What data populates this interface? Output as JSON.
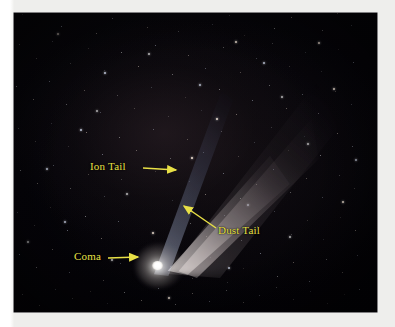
{
  "figure": {
    "kind": "annotated-astrophotograph",
    "background_color": "#040307",
    "frame_color": "#ffffff",
    "annotation_color": "#e8e046"
  },
  "annotations": [
    {
      "id": "ion-tail",
      "label": "Ion Tail",
      "icon": "arrow-right-icon",
      "arrow_direction": "right",
      "label_x": 90,
      "label_y": 160,
      "arrow_start": [
        143,
        168
      ],
      "arrow_end": [
        176,
        170
      ]
    },
    {
      "id": "dust-tail",
      "label": "Dust Tail",
      "icon": "arrow-up-left-icon",
      "arrow_direction": "up-left",
      "label_x": 218,
      "label_y": 224,
      "arrow_start": [
        216,
        228
      ],
      "arrow_end": [
        184,
        206
      ]
    },
    {
      "id": "coma",
      "label": "Coma",
      "icon": "arrow-right-icon",
      "arrow_direction": "right",
      "label_x": 74,
      "label_y": 250,
      "arrow_start": [
        108,
        258
      ],
      "arrow_end": [
        138,
        257
      ]
    }
  ],
  "features": {
    "coma": {
      "name": "Coma",
      "description": "bright white nucleus and surrounding coma",
      "center": [
        143,
        253
      ]
    },
    "ion_tail": {
      "name": "Ion Tail",
      "description": "narrow bluish streak along the upper-left edge of the tail fan",
      "color": "#aab4d4"
    },
    "dust_tail": {
      "name": "Dust Tail",
      "description": "broad whitish-tan fan sweeping up and to the right",
      "color": "#d8d0cc"
    }
  },
  "stars": {
    "faint": [
      [
        22,
        14
      ],
      [
        44,
        9
      ],
      [
        61,
        26
      ],
      [
        83,
        6
      ],
      [
        96,
        33
      ],
      [
        112,
        18
      ],
      [
        129,
        8
      ],
      [
        147,
        27
      ],
      [
        161,
        12
      ],
      [
        178,
        31
      ],
      [
        196,
        7
      ],
      [
        212,
        24
      ],
      [
        229,
        15
      ],
      [
        244,
        35
      ],
      [
        258,
        10
      ],
      [
        274,
        28
      ],
      [
        291,
        17
      ],
      [
        306,
        6
      ],
      [
        322,
        30
      ],
      [
        337,
        13
      ],
      [
        351,
        25
      ],
      [
        19,
        44
      ],
      [
        36,
        58
      ],
      [
        52,
        41
      ],
      [
        70,
        63
      ],
      [
        88,
        48
      ],
      [
        104,
        70
      ],
      [
        121,
        52
      ],
      [
        138,
        66
      ],
      [
        155,
        45
      ],
      [
        172,
        74
      ],
      [
        188,
        55
      ],
      [
        205,
        68
      ],
      [
        223,
        47
      ],
      [
        240,
        72
      ],
      [
        256,
        58
      ],
      [
        272,
        43
      ],
      [
        289,
        66
      ],
      [
        305,
        52
      ],
      [
        321,
        71
      ],
      [
        338,
        49
      ],
      [
        353,
        62
      ],
      [
        16,
        86
      ],
      [
        33,
        99
      ],
      [
        49,
        81
      ],
      [
        66,
        104
      ],
      [
        84,
        90
      ],
      [
        100,
        112
      ],
      [
        117,
        95
      ],
      [
        134,
        108
      ],
      [
        151,
        87
      ],
      [
        168,
        116
      ],
      [
        185,
        97
      ],
      [
        201,
        110
      ],
      [
        219,
        89
      ],
      [
        236,
        114
      ],
      [
        252,
        100
      ],
      [
        269,
        85
      ],
      [
        286,
        108
      ],
      [
        302,
        94
      ],
      [
        318,
        113
      ],
      [
        335,
        91
      ],
      [
        351,
        104
      ],
      [
        18,
        128
      ],
      [
        35,
        141
      ],
      [
        51,
        123
      ],
      [
        68,
        146
      ],
      [
        86,
        132
      ],
      [
        102,
        154
      ],
      [
        119,
        137
      ],
      [
        136,
        150
      ],
      [
        153,
        129
      ],
      [
        170,
        158
      ],
      [
        187,
        139
      ],
      [
        203,
        152
      ],
      [
        221,
        131
      ],
      [
        238,
        156
      ],
      [
        254,
        142
      ],
      [
        271,
        127
      ],
      [
        288,
        150
      ],
      [
        304,
        136
      ],
      [
        320,
        155
      ],
      [
        337,
        133
      ],
      [
        352,
        146
      ],
      [
        20,
        170
      ],
      [
        37,
        183
      ],
      [
        53,
        165
      ],
      [
        70,
        188
      ],
      [
        88,
        174
      ],
      [
        104,
        196
      ],
      [
        121,
        179
      ],
      [
        155,
        171
      ],
      [
        172,
        200
      ],
      [
        189,
        181
      ],
      [
        205,
        194
      ],
      [
        223,
        173
      ],
      [
        240,
        198
      ],
      [
        256,
        184
      ],
      [
        273,
        169
      ],
      [
        290,
        192
      ],
      [
        306,
        178
      ],
      [
        322,
        197
      ],
      [
        339,
        175
      ],
      [
        354,
        188
      ],
      [
        17,
        212
      ],
      [
        34,
        225
      ],
      [
        50,
        207
      ],
      [
        67,
        230
      ],
      [
        85,
        216
      ],
      [
        101,
        238
      ],
      [
        118,
        221
      ],
      [
        190,
        223
      ],
      [
        206,
        236
      ],
      [
        224,
        215
      ],
      [
        241,
        240
      ],
      [
        257,
        226
      ],
      [
        274,
        211
      ],
      [
        291,
        234
      ],
      [
        307,
        220
      ],
      [
        323,
        239
      ],
      [
        340,
        217
      ],
      [
        355,
        230
      ],
      [
        19,
        254
      ],
      [
        36,
        267
      ],
      [
        52,
        249
      ],
      [
        69,
        272
      ],
      [
        87,
        258
      ],
      [
        103,
        280
      ],
      [
        120,
        263
      ],
      [
        170,
        266
      ],
      [
        192,
        278
      ],
      [
        210,
        257
      ],
      [
        227,
        282
      ],
      [
        243,
        268
      ],
      [
        260,
        253
      ],
      [
        277,
        276
      ],
      [
        293,
        262
      ],
      [
        309,
        281
      ],
      [
        326,
        259
      ],
      [
        342,
        272
      ],
      [
        357,
        255
      ],
      [
        22,
        294
      ],
      [
        39,
        305
      ],
      [
        55,
        289
      ],
      [
        72,
        298
      ],
      [
        90,
        291
      ],
      [
        107,
        303
      ],
      [
        124,
        292
      ],
      [
        141,
        300
      ],
      [
        158,
        288
      ],
      [
        175,
        304
      ],
      [
        192,
        293
      ],
      [
        209,
        301
      ],
      [
        226,
        290
      ],
      [
        243,
        302
      ],
      [
        259,
        295
      ],
      [
        276,
        287
      ],
      [
        293,
        299
      ],
      [
        310,
        291
      ],
      [
        327,
        303
      ],
      [
        344,
        294
      ],
      [
        359,
        289
      ]
    ],
    "bright": [
      [
        57,
        33
      ],
      [
        104,
        72
      ],
      [
        148,
        53
      ],
      [
        216,
        118
      ],
      [
        263,
        62
      ],
      [
        307,
        143
      ],
      [
        333,
        88
      ],
      [
        80,
        129
      ],
      [
        126,
        193
      ],
      [
        191,
        157
      ],
      [
        247,
        204
      ],
      [
        289,
        236
      ],
      [
        342,
        201
      ],
      [
        64,
        221
      ],
      [
        111,
        259
      ],
      [
        168,
        297
      ],
      [
        228,
        267
      ],
      [
        281,
        96
      ],
      [
        318,
        42
      ],
      [
        46,
        168
      ],
      [
        96,
        110
      ],
      [
        235,
        41
      ],
      [
        355,
        159
      ],
      [
        27,
        241
      ],
      [
        152,
        232
      ],
      [
        199,
        84
      ]
    ]
  }
}
